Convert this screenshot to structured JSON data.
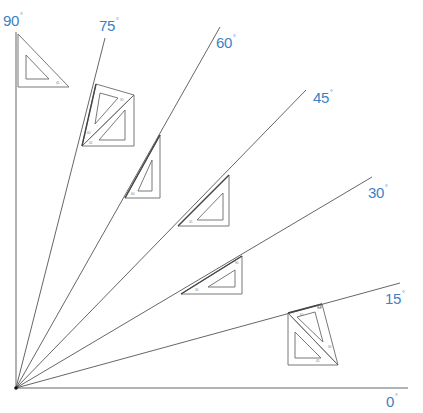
{
  "diagram": {
    "title": "",
    "origin": {
      "x": 16,
      "y": 388
    },
    "label_color": "#3b82c4",
    "line_color": "#555555",
    "rays": [
      {
        "angle": 0,
        "label": "0",
        "degree_symbol": "°",
        "end": {
          "x": 408,
          "y": 388
        },
        "label_pos": {
          "x": 386,
          "y": 394
        }
      },
      {
        "angle": 15,
        "label": "15",
        "degree_symbol": "°",
        "end": {
          "x": 400,
          "y": 283
        },
        "label_pos": {
          "x": 385,
          "y": 291
        }
      },
      {
        "angle": 30,
        "label": "30",
        "degree_symbol": "°",
        "end": {
          "x": 372,
          "y": 177
        },
        "label_pos": {
          "x": 368,
          "y": 185
        }
      },
      {
        "angle": 45,
        "label": "45",
        "degree_symbol": "°",
        "end": {
          "x": 306,
          "y": 90
        },
        "label_pos": {
          "x": 313,
          "y": 89
        }
      },
      {
        "angle": 60,
        "label": "60",
        "degree_symbol": "°",
        "end": {
          "x": 220,
          "y": 27
        },
        "label_pos": {
          "x": 216,
          "y": 35
        }
      },
      {
        "angle": 75,
        "label": "75",
        "degree_symbol": "°",
        "end": {
          "x": 105,
          "y": 38
        },
        "label_pos": {
          "x": 99,
          "y": 18
        }
      },
      {
        "angle": 90,
        "label": "90",
        "degree_symbol": "°",
        "end": {
          "x": 16,
          "y": 32
        },
        "label_pos": {
          "x": 3,
          "y": 13
        }
      }
    ],
    "triangles": [
      {
        "name": "90-degree-setsquare-position",
        "description": "45° set square against vertical line"
      },
      {
        "name": "75-degree-setsquare-combination",
        "description": "45° and 30/60 set squares combined"
      },
      {
        "name": "60-degree-setsquare-position",
        "description": "30/60 set square"
      },
      {
        "name": "45-degree-setsquare-position",
        "description": "45° set square"
      },
      {
        "name": "30-degree-setsquare-position",
        "description": "30/60 set square"
      },
      {
        "name": "15-degree-setsquare-combination",
        "description": "45° and 30/60 set squares combined"
      }
    ]
  }
}
